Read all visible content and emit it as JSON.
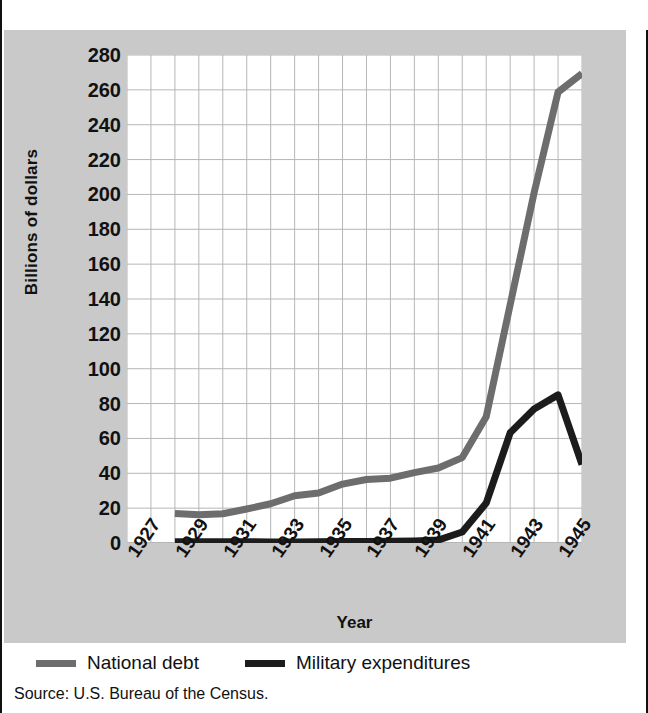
{
  "figure": {
    "title_clipped": "Public Debt and Military Spending",
    "source": "Source: U.S. Bureau of the Census."
  },
  "legend": {
    "entries": [
      {
        "label": "National debt",
        "color": "#6d6d6d",
        "icon": "line-swatch-icon"
      },
      {
        "label": "Military expenditures",
        "color": "#1c1c1c",
        "icon": "line-swatch-icon"
      }
    ]
  },
  "chart_data": {
    "type": "line",
    "title": "",
    "xlabel": "Year",
    "ylabel": "Billions of dollars",
    "xlim": [
      1927,
      1946
    ],
    "ylim": [
      0,
      280
    ],
    "ytick_step": 20,
    "yticks": [
      280,
      260,
      240,
      220,
      200,
      180,
      160,
      140,
      120,
      100,
      80,
      60,
      40,
      20,
      0
    ],
    "xticks": [
      1927,
      1929,
      1931,
      1933,
      1935,
      1937,
      1939,
      1941,
      1943,
      1945
    ],
    "x": [
      1929,
      1930,
      1931,
      1932,
      1933,
      1934,
      1935,
      1936,
      1937,
      1938,
      1939,
      1940,
      1941,
      1942,
      1943,
      1944,
      1945,
      1946
    ],
    "grid": "both",
    "grid_color": "#b6b6b6",
    "legend_position": "below",
    "series": [
      {
        "name": "National debt",
        "color": "#6d6d6d",
        "x": [
          1929,
          1930,
          1931,
          1932,
          1933,
          1934,
          1935,
          1936,
          1937,
          1938,
          1939,
          1940,
          1941,
          1942,
          1943,
          1944,
          1945,
          1946
        ],
        "values": [
          16.9,
          16.2,
          16.8,
          19.5,
          22.5,
          27.1,
          28.7,
          33.8,
          36.4,
          37.2,
          40.4,
          43.0,
          49.0,
          72.4,
          136.7,
          201.0,
          258.7,
          269.4
        ]
      },
      {
        "name": "Military expenditures",
        "color": "#1c1c1c",
        "x": [
          1929,
          1930,
          1931,
          1932,
          1933,
          1934,
          1935,
          1936,
          1937,
          1938,
          1939,
          1940,
          1941,
          1942,
          1943,
          1944,
          1945,
          1946
        ],
        "values": [
          0.7,
          0.7,
          0.7,
          0.7,
          0.6,
          0.6,
          0.7,
          0.9,
          0.9,
          1.0,
          1.2,
          1.7,
          6.3,
          22.9,
          63.2,
          76.9,
          85.0,
          45.0
        ]
      }
    ]
  }
}
